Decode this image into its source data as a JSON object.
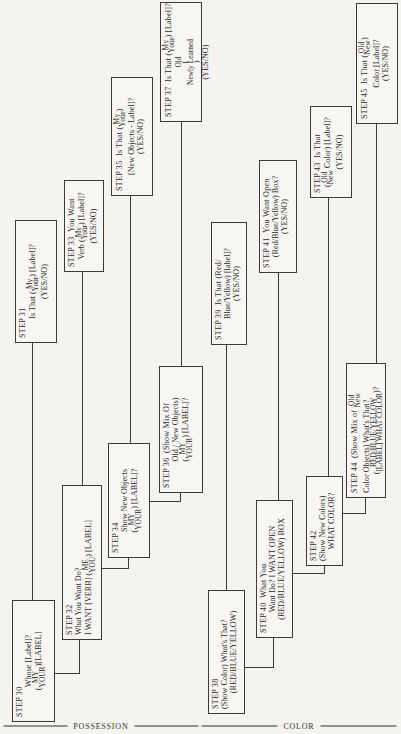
{
  "sections": [
    {
      "id": "possession",
      "label": "POSSESSION"
    },
    {
      "id": "color",
      "label": "COLOR"
    }
  ],
  "steps": {
    "s30": {
      "step": "STEP 30",
      "q": "Whose [Label]?",
      "a_top": "MY",
      "a_bot": "YOUR",
      "a_tail": "[LABEL]"
    },
    "s31": {
      "step": "STEP 31",
      "pre": "Is That (",
      "top": "My",
      "bot": "Your",
      "post": ") [Label]?",
      "yn": "(YES/NO)"
    },
    "s32": {
      "step": "STEP 32",
      "q": "What You Want Do?",
      "pre": "I WANT [VERB] (",
      "top": "ME",
      "bot": "YOU",
      "post": ") [LABEL]"
    },
    "s33": {
      "step": "STEP 33",
      "q": "You Want",
      "pre": "Verb (",
      "top": "My",
      "bot": "Your",
      "post": ") [Label]?",
      "yn": "(YES/NO)"
    },
    "s34": {
      "step": "STEP 34",
      "q": "Show New Objects",
      "top": "MY",
      "bot": "YOUR",
      "post": ") [LABEL]?"
    },
    "s35": {
      "step": "STEP 35",
      "q": "Is That (",
      "top": "My",
      "bot": "Your",
      "post": ")",
      "l2": "[New Objects - Label]?",
      "yn": "(YES/NO)"
    },
    "s36": {
      "step": "STEP 36",
      "q": "(Show Mix Of",
      "l2": "Old / New Objects)",
      "top": "MY",
      "bot": "YOUR",
      "post": ") [LABEL]?"
    },
    "s37": {
      "step": "STEP 37",
      "q": "Is That (",
      "top": "My",
      "bot": "Your",
      "post": ") [Label]?",
      "old": "Old",
      "nl": "Newly Learned",
      "yn": "(YES/NO)"
    },
    "s38": {
      "step": "STEP 38",
      "q": "(Show Color) What's That?",
      "a": "(RED/BLUE/YELLOW)"
    },
    "s39": {
      "step": "STEP 39",
      "q": "Is That (Red/",
      "l2": "Blue/Yellow) [label]?",
      "yn": "(YES/NO)"
    },
    "s40": {
      "step": "STEP 40",
      "q": "What You",
      "l2": "Want Do? I WANT OPEN",
      "l3": "(RED/BLUE/YELLOW) BOX"
    },
    "s41": {
      "step": "STEP 41",
      "q": "You Want Open",
      "l2": "(Red/Blue/Yellow) Box?",
      "yn": "(YES/NO)"
    },
    "s42": {
      "step": "STEP 42",
      "q": "(Show New Colors)",
      "a": "WHAT COLOR?"
    },
    "s43": {
      "step": "STEP 43",
      "q": "Is That",
      "top": "Old",
      "bot": "New",
      "post": "Color) [Label]?",
      "yn": "(YES/NO)"
    },
    "s44": {
      "step": "STEP 44",
      "q": "(Show Mix of",
      "top": "Old",
      "bot": "New",
      "l2": "Color Objects) What's That?",
      "a1": "RED/BLUE/YELLOW",
      "a2": "[LABEL] WHAT COLOR",
      "qm": "?"
    },
    "s45": {
      "step": "STEP 45",
      "q": "Is That (",
      "top": "Old",
      "bot": "New",
      "post": ")",
      "l2": "Color [Label]?",
      "yn": "(YES/NO)"
    }
  },
  "colors": {
    "line": "#3a3a3a",
    "paper": "#f4f3f0",
    "text": "#2a2a2a"
  }
}
